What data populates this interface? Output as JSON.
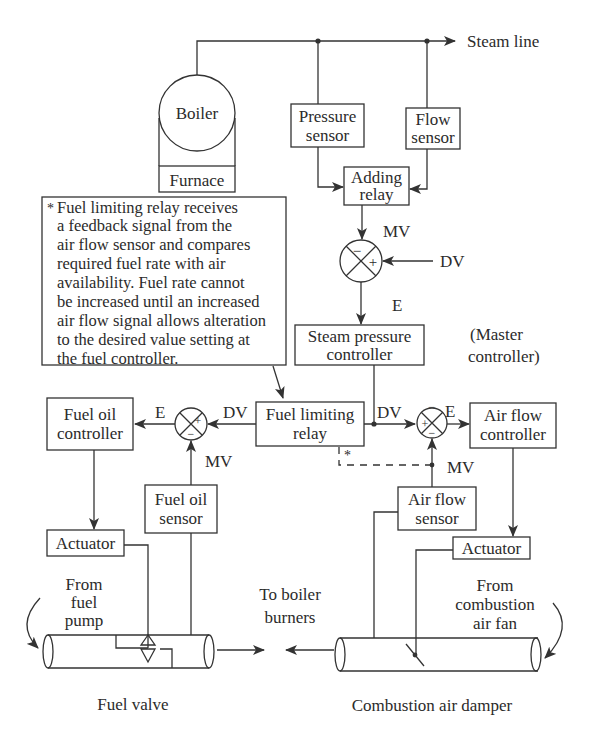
{
  "diagram": {
    "steam_line": "Steam line",
    "boiler": "Boiler",
    "furnace": "Furnace",
    "pressure_sensor": [
      "Pressure",
      "sensor"
    ],
    "flow_sensor": [
      "Flow",
      "sensor"
    ],
    "adding_relay": [
      "Adding",
      "relay"
    ],
    "master": {
      "mv": "MV",
      "dv": "DV",
      "e": "E",
      "minus": "−",
      "plus": "+"
    },
    "steam_pressure_controller": [
      "Steam pressure",
      "controller"
    ],
    "master_controller_note": [
      "(Master",
      "controller)"
    ],
    "note": {
      "star": "*",
      "lines": [
        "Fuel limiting relay receives",
        "a feedback signal from the",
        "air flow sensor and compares",
        "required fuel rate with air",
        "availability. Fuel rate cannot",
        "be increased until an increased",
        "air flow signal allows alteration",
        "to the desired value setting at",
        "the fuel controller."
      ]
    },
    "fuel_limiting_relay": [
      "Fuel limiting",
      "relay"
    ],
    "fuel_oil_controller": [
      "Fuel oil",
      "controller"
    ],
    "fuel_loop": {
      "e": "E",
      "dv": "DV",
      "mv": "MV",
      "plus": "+",
      "minus": "−"
    },
    "air_loop": {
      "e": "E",
      "dv": "DV",
      "mv": "MV",
      "plus": "+",
      "minus": "−",
      "star": "*"
    },
    "air_flow_controller": [
      "Air flow",
      "controller"
    ],
    "fuel_oil_sensor": [
      "Fuel oil",
      "sensor"
    ],
    "air_flow_sensor": [
      "Air flow",
      "sensor"
    ],
    "actuator_left": "Actuator",
    "actuator_right": "Actuator",
    "from_fuel_pump": [
      "From",
      "fuel",
      "pump"
    ],
    "to_boiler_burners": [
      "To boiler",
      "burners"
    ],
    "from_combustion_air_fan": [
      "From",
      "combustion",
      "air fan"
    ],
    "fuel_valve": "Fuel valve",
    "combustion_air_damper": "Combustion air damper"
  }
}
